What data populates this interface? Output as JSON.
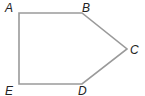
{
  "figure": {
    "type": "pentagon",
    "stroke_color": "#9a9a9a",
    "fill_color": "#ffffff",
    "vertices": [
      {
        "label": "A",
        "x": 19,
        "y": 13,
        "label_x": 5,
        "label_y": 12
      },
      {
        "label": "B",
        "x": 82,
        "y": 13,
        "label_x": 82,
        "label_y": 12
      },
      {
        "label": "C",
        "x": 127,
        "y": 49,
        "label_x": 130,
        "label_y": 54
      },
      {
        "label": "D",
        "x": 82,
        "y": 84,
        "label_x": 78,
        "label_y": 95
      },
      {
        "label": "E",
        "x": 19,
        "y": 84,
        "label_x": 5,
        "label_y": 95
      }
    ]
  }
}
